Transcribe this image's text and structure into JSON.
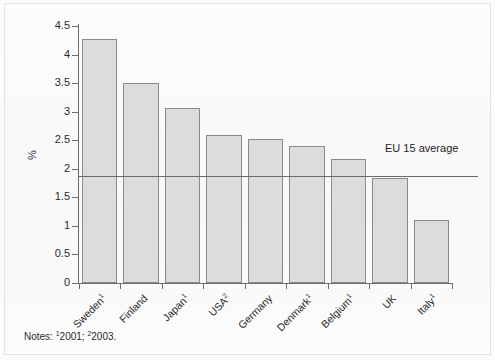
{
  "chart_data": {
    "type": "bar",
    "title": "",
    "subtitle": "",
    "xlabel": "",
    "ylabel": "%",
    "ylim": [
      0,
      4.5
    ],
    "yticks": [
      "0",
      "0.5",
      "1",
      "1.5",
      "2",
      "2.5",
      "3",
      "3.5",
      "4",
      "4.5"
    ],
    "ytick_values": [
      0,
      0.5,
      1,
      1.5,
      2,
      2.5,
      3,
      3.5,
      4,
      4.5
    ],
    "grid": false,
    "legend_position": "none",
    "categories": [
      "Sweden",
      "Finland",
      "Japan",
      "USA",
      "Germany",
      "Denmark",
      "Belgium",
      "UK",
      "Italy"
    ],
    "category_footnotes": [
      "1",
      "",
      "1",
      "2",
      "",
      "1",
      "1",
      "",
      "1"
    ],
    "values": [
      4.27,
      3.5,
      3.07,
      2.59,
      2.52,
      2.4,
      2.17,
      1.84,
      1.11
    ],
    "reference_line": {
      "label": "EU 15 average",
      "value": 1.87
    },
    "annotations": [
      "Notes: 12001; 22003."
    ],
    "bar_color": "#dcdcdc",
    "bar_border_color": "#8a8a8a",
    "axis_color": "#6d6d6d"
  },
  "notes": {
    "prefix": "Notes: ",
    "item1_sup": "1",
    "item1_text": "2001; ",
    "item2_sup": "2",
    "item2_text": "2003."
  }
}
